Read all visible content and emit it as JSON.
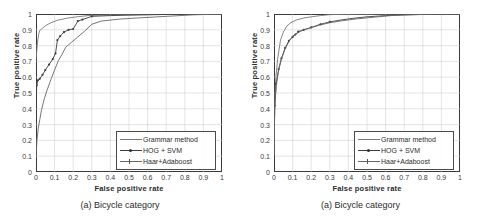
{
  "figure": {
    "panels": [
      {
        "caption": "(a) Bicycle category",
        "chart_data": {
          "type": "line",
          "title": "",
          "xlabel": "False positive rate",
          "ylabel": "True positive rate",
          "xlim": [
            0,
            1
          ],
          "ylim": [
            0,
            1
          ],
          "xticks": [
            "0",
            "0.1",
            "0.2",
            "0.3",
            "0.4",
            "0.5",
            "0.6",
            "0.7",
            "0.8",
            "0.9",
            "1"
          ],
          "yticks": [
            "0",
            "0.1",
            "0.2",
            "0.3",
            "0.4",
            "0.5",
            "0.6",
            "0.7",
            "0.8",
            "0.9",
            "1"
          ],
          "grid": true,
          "legend_position": "lower-right",
          "series": [
            {
              "name": "Grammar method",
              "color": "#777777",
              "marker": "none",
              "x": [
                0,
                0.005,
                0.01,
                0.015,
                0.02,
                0.03,
                0.05,
                0.08,
                0.12,
                0.17,
                0.22,
                0.28,
                0.35,
                0.45,
                0.55,
                0.65,
                0.75,
                0.85,
                0.92,
                1
              ],
              "y": [
                0.71,
                0.78,
                0.84,
                0.875,
                0.895,
                0.905,
                0.925,
                0.945,
                0.962,
                0.974,
                0.982,
                0.99,
                0.993,
                0.995,
                0.996,
                0.997,
                0.998,
                0.999,
                1,
                1
              ]
            },
            {
              "name": "HOG + SVM",
              "color": "#3d3d3d",
              "marker": "dot",
              "x": [
                0,
                0.004,
                0.01,
                0.02,
                0.035,
                0.05,
                0.07,
                0.09,
                0.105,
                0.115,
                0.13,
                0.15,
                0.175,
                0.2,
                0.225,
                0.25,
                0.3,
                0.4,
                0.5,
                0.6,
                0.75,
                0.9,
                1
              ],
              "y": [
                0.41,
                0.55,
                0.58,
                0.59,
                0.615,
                0.645,
                0.68,
                0.715,
                0.75,
                0.835,
                0.86,
                0.885,
                0.9,
                0.905,
                0.955,
                0.965,
                0.985,
                0.99,
                0.993,
                0.995,
                0.998,
                1,
                1
              ]
            },
            {
              "name": "Haar+Adaboost",
              "color": "#666666",
              "marker": "none",
              "x": [
                0,
                0.005,
                0.012,
                0.02,
                0.03,
                0.045,
                0.06,
                0.08,
                0.1,
                0.12,
                0.14,
                0.16,
                0.19,
                0.22,
                0.26,
                0.3,
                0.35,
                0.45,
                0.55,
                0.7,
                0.85,
                1
              ],
              "y": [
                0.09,
                0.2,
                0.275,
                0.33,
                0.395,
                0.465,
                0.52,
                0.585,
                0.645,
                0.705,
                0.745,
                0.79,
                0.82,
                0.85,
                0.89,
                0.935,
                0.955,
                0.968,
                0.975,
                0.985,
                0.995,
                1
              ]
            }
          ]
        }
      },
      {
        "caption": "(a) Bicycle category",
        "chart_data": {
          "type": "line",
          "title": "",
          "xlabel": "False positive rate",
          "ylabel": "True positive rate",
          "xlim": [
            0,
            1
          ],
          "ylim": [
            0,
            1
          ],
          "xticks": [
            "0",
            "0.1",
            "0.2",
            "0.3",
            "0.4",
            "0.5",
            "0.6",
            "0.7",
            "0.8",
            "0.9",
            "1"
          ],
          "yticks": [
            "0",
            "0.1",
            "0.2",
            "0.3",
            "0.4",
            "0.5",
            "0.6",
            "0.7",
            "0.8",
            "0.9",
            "1"
          ],
          "grid": true,
          "legend_position": "lower-right",
          "series": [
            {
              "name": "Grammar method",
              "color": "#777777",
              "marker": "none",
              "x": [
                0,
                0.004,
                0.01,
                0.02,
                0.035,
                0.05,
                0.07,
                0.09,
                0.12,
                0.16,
                0.2,
                0.25,
                0.3,
                0.38,
                0.46,
                0.55,
                0.65,
                0.78,
                0.9,
                1
              ],
              "y": [
                0.12,
                0.45,
                0.6,
                0.72,
                0.835,
                0.885,
                0.925,
                0.945,
                0.962,
                0.975,
                0.982,
                0.99,
                0.996,
                0.998,
                0.999,
                1,
                1,
                1,
                1,
                1
              ]
            },
            {
              "name": "HOG + SVM",
              "color": "#3d3d3d",
              "marker": "dot",
              "x": [
                0,
                0.004,
                0.012,
                0.025,
                0.04,
                0.06,
                0.08,
                0.1,
                0.115,
                0.13,
                0.16,
                0.2,
                0.25,
                0.3,
                0.36,
                0.42,
                0.5,
                0.6,
                0.68,
                0.8,
                0.9,
                1
              ],
              "y": [
                0.1,
                0.42,
                0.56,
                0.65,
                0.72,
                0.785,
                0.83,
                0.855,
                0.87,
                0.888,
                0.9,
                0.915,
                0.935,
                0.95,
                0.962,
                0.972,
                0.982,
                0.99,
                0.994,
                0.997,
                0.999,
                1
              ]
            },
            {
              "name": "Haar+Adaboost",
              "color": "#666666",
              "marker": "none",
              "x": [
                0,
                0.004,
                0.012,
                0.025,
                0.04,
                0.06,
                0.08,
                0.1,
                0.12,
                0.15,
                0.19,
                0.24,
                0.3,
                0.37,
                0.45,
                0.54,
                0.63,
                0.72,
                0.85,
                1
              ],
              "y": [
                0.1,
                0.41,
                0.55,
                0.645,
                0.715,
                0.78,
                0.825,
                0.86,
                0.875,
                0.895,
                0.91,
                0.928,
                0.945,
                0.958,
                0.97,
                0.98,
                0.99,
                0.995,
                0.999,
                1
              ]
            }
          ]
        }
      }
    ]
  }
}
